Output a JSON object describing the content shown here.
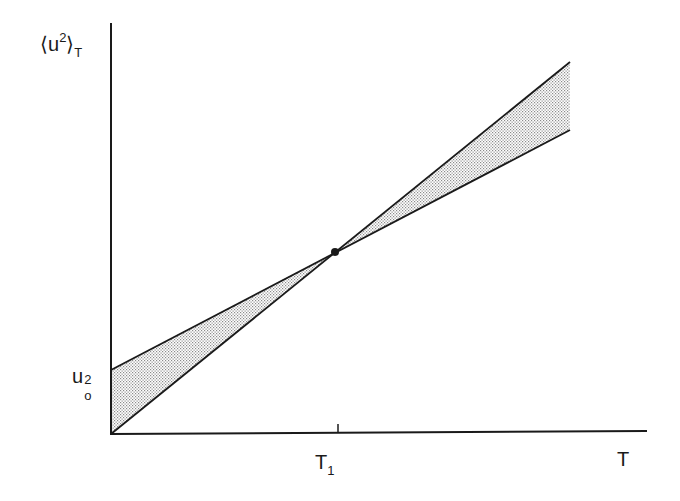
{
  "diagram": {
    "y_axis_label": {
      "open": "⟨",
      "base": "u",
      "sup": "2",
      "close": "⟩",
      "sub": "T"
    },
    "x_axis_label": "T",
    "tick_x": {
      "base": "T",
      "sub": "1"
    },
    "tick_y": {
      "base": "u",
      "sup": "2",
      "sub": "o"
    },
    "lines": [
      {
        "name": "steep-line",
        "from": "origin",
        "through": "T1 point"
      },
      {
        "name": "shallow-line",
        "from": "u0^2 intercept",
        "through": "T1 point"
      }
    ],
    "shaded_regions": [
      "between lines left of T1",
      "between lines right of T1"
    ],
    "intersection_point": "T1"
  },
  "colors": {
    "ink": "#1a1a1a",
    "shade": "#9a9a9a"
  }
}
